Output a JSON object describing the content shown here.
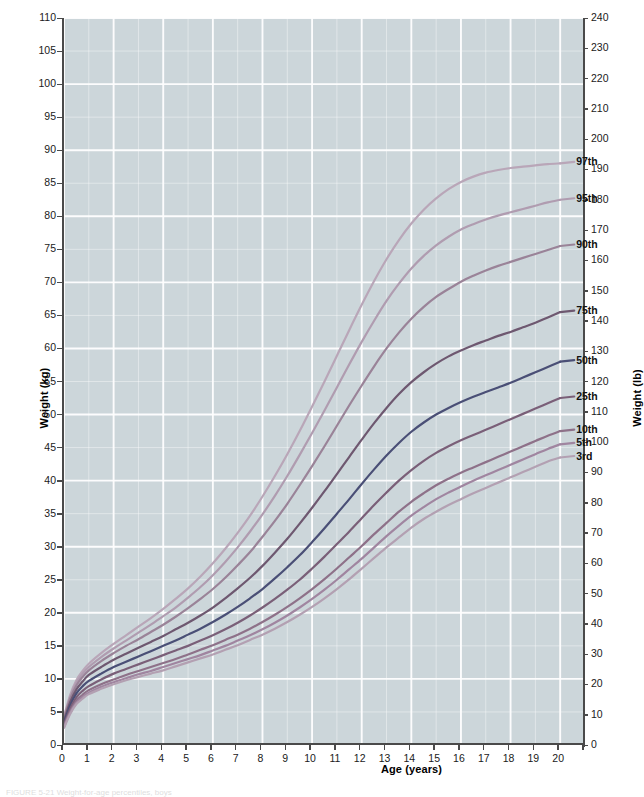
{
  "figure": {
    "caption": "FIGURE 5-21   Weight-for-age percentiles, boys"
  },
  "chart_data": {
    "type": "line",
    "title": "",
    "xlabel": "Age (years)",
    "ylabel": "Weight (kg)",
    "ylabel_secondary": "Weight (lb)",
    "xlim": [
      0,
      21
    ],
    "ylim": [
      0,
      110
    ],
    "ylim_secondary": [
      0,
      240
    ],
    "grid": true,
    "legend_position": "inline-right-end-labels",
    "background_color": "#ccd6da",
    "gridline_color": "#ffffff",
    "axis_color": "#4a4a4a",
    "xticks": [
      0,
      1,
      2,
      3,
      4,
      5,
      6,
      7,
      8,
      9,
      10,
      11,
      12,
      13,
      14,
      15,
      16,
      17,
      18,
      19,
      20
    ],
    "xtick_labels": [
      "0",
      "1",
      "2",
      "3",
      "4",
      "5",
      "6",
      "7",
      "8",
      "9",
      "10",
      "11",
      "12",
      "13",
      "14",
      "15",
      "16",
      "17",
      "18",
      "19",
      "20"
    ],
    "yticks": [
      0,
      5,
      10,
      15,
      20,
      25,
      30,
      35,
      40,
      45,
      50,
      55,
      60,
      65,
      70,
      75,
      80,
      85,
      90,
      95,
      100,
      105,
      110
    ],
    "ytick_labels": [
      "0",
      "5",
      "10",
      "15",
      "20",
      "25",
      "30",
      "35",
      "40",
      "45",
      "50",
      "55",
      "60",
      "65",
      "70",
      "75",
      "80",
      "85",
      "90",
      "95",
      "100",
      "105",
      "110"
    ],
    "yticks_secondary": [
      0,
      10,
      20,
      30,
      40,
      50,
      60,
      70,
      80,
      90,
      100,
      110,
      120,
      130,
      140,
      150,
      160,
      170,
      180,
      190,
      200,
      210,
      220,
      230,
      240
    ],
    "ytick_labels_secondary": [
      "0",
      "10",
      "20",
      "30",
      "40",
      "50",
      "60",
      "70",
      "80",
      "90",
      "100",
      "110",
      "120",
      "130",
      "140",
      "150",
      "160",
      "170",
      "180",
      "190",
      "200",
      "210",
      "220",
      "230",
      "240"
    ],
    "x": [
      0,
      0.25,
      0.5,
      0.75,
      1,
      1.5,
      2,
      2.5,
      3,
      3.5,
      4,
      4.5,
      5,
      5.5,
      6,
      6.5,
      7,
      7.5,
      8,
      8.5,
      9,
      9.5,
      10,
      10.5,
      11,
      11.5,
      12,
      12.5,
      13,
      13.5,
      14,
      14.5,
      15,
      15.5,
      16,
      16.5,
      17,
      17.5,
      18,
      18.5,
      19,
      19.5,
      20
    ],
    "series": [
      {
        "name": "97th",
        "label": "97th",
        "color": "#b9a6b8",
        "end_value_kg": 88.0,
        "end_value_lb": 194,
        "values": [
          4.3,
          7.6,
          9.8,
          11.2,
          12.3,
          13.9,
          15.3,
          16.6,
          17.9,
          19.2,
          20.6,
          22.1,
          23.7,
          25.5,
          27.5,
          29.7,
          32.1,
          34.7,
          37.6,
          40.7,
          44.0,
          47.5,
          51.2,
          55.0,
          58.9,
          62.8,
          66.6,
          70.2,
          73.5,
          76.4,
          78.9,
          81.0,
          82.7,
          84.1,
          85.2,
          86.0,
          86.6,
          87.0,
          87.3,
          87.5,
          87.7,
          87.9,
          88.0
        ]
      },
      {
        "name": "95th",
        "label": "95th",
        "color": "#b09cb0",
        "end_value_kg": 82.5,
        "end_value_lb": 182,
        "values": [
          4.2,
          7.3,
          9.4,
          10.8,
          11.8,
          13.3,
          14.6,
          15.8,
          17.0,
          18.2,
          19.5,
          20.8,
          22.3,
          23.9,
          25.7,
          27.7,
          29.9,
          32.3,
          34.9,
          37.7,
          40.7,
          43.9,
          47.2,
          50.6,
          54.1,
          57.6,
          61.0,
          64.2,
          67.2,
          69.8,
          72.1,
          74.0,
          75.6,
          76.9,
          78.0,
          78.8,
          79.5,
          80.1,
          80.6,
          81.1,
          81.6,
          82.1,
          82.5
        ]
      },
      {
        "name": "90th",
        "label": "90th",
        "color": "#9a8398",
        "end_value_kg": 75.5,
        "end_value_lb": 166,
        "values": [
          4.0,
          7.0,
          9.0,
          10.3,
          11.3,
          12.7,
          13.9,
          15.0,
          16.0,
          17.1,
          18.2,
          19.4,
          20.7,
          22.1,
          23.6,
          25.3,
          27.2,
          29.2,
          31.5,
          33.9,
          36.5,
          39.3,
          42.2,
          45.2,
          48.3,
          51.4,
          54.4,
          57.3,
          60.0,
          62.4,
          64.5,
          66.3,
          67.8,
          69.0,
          70.1,
          71.0,
          71.8,
          72.5,
          73.1,
          73.7,
          74.3,
          74.9,
          75.5
        ]
      },
      {
        "name": "75th",
        "label": "75th",
        "color": "#6e5870",
        "end_value_kg": 65.5,
        "end_value_lb": 144,
        "values": [
          3.7,
          6.5,
          8.4,
          9.6,
          10.6,
          11.8,
          12.9,
          13.8,
          14.7,
          15.6,
          16.5,
          17.5,
          18.5,
          19.6,
          20.8,
          22.2,
          23.7,
          25.3,
          27.1,
          29.1,
          31.2,
          33.5,
          35.9,
          38.4,
          41.0,
          43.6,
          46.2,
          48.7,
          51.0,
          53.1,
          54.9,
          56.4,
          57.7,
          58.8,
          59.7,
          60.5,
          61.2,
          61.9,
          62.5,
          63.2,
          63.9,
          64.7,
          65.5
        ]
      },
      {
        "name": "50th",
        "label": "50th",
        "color": "#4a4f76",
        "end_value_kg": 58.0,
        "end_value_lb": 128,
        "values": [
          3.4,
          6.0,
          7.8,
          8.9,
          9.7,
          10.8,
          11.8,
          12.6,
          13.4,
          14.2,
          15.0,
          15.8,
          16.7,
          17.6,
          18.6,
          19.7,
          20.9,
          22.2,
          23.6,
          25.2,
          26.9,
          28.7,
          30.7,
          32.8,
          35.0,
          37.2,
          39.5,
          41.7,
          43.8,
          45.7,
          47.4,
          48.8,
          50.0,
          51.0,
          51.9,
          52.7,
          53.4,
          54.1,
          54.8,
          55.6,
          56.4,
          57.2,
          58.0
        ]
      },
      {
        "name": "25th",
        "label": "25th",
        "color": "#7a5f78",
        "end_value_kg": 52.5,
        "end_value_lb": 116,
        "values": [
          3.1,
          5.5,
          7.2,
          8.2,
          8.9,
          9.9,
          10.8,
          11.5,
          12.2,
          12.9,
          13.6,
          14.3,
          15.0,
          15.8,
          16.6,
          17.5,
          18.5,
          19.6,
          20.8,
          22.1,
          23.5,
          25.0,
          26.7,
          28.5,
          30.4,
          32.3,
          34.3,
          36.3,
          38.2,
          40.0,
          41.6,
          43.0,
          44.2,
          45.2,
          46.1,
          46.9,
          47.7,
          48.5,
          49.3,
          50.1,
          50.9,
          51.7,
          52.5
        ]
      },
      {
        "name": "10th",
        "label": "10th",
        "color": "#8e7189",
        "end_value_kg": 47.5,
        "end_value_lb": 105,
        "values": [
          2.9,
          5.1,
          6.7,
          7.6,
          8.3,
          9.2,
          9.9,
          10.6,
          11.2,
          11.8,
          12.4,
          13.0,
          13.7,
          14.4,
          15.1,
          15.9,
          16.7,
          17.6,
          18.6,
          19.7,
          20.9,
          22.2,
          23.6,
          25.1,
          26.7,
          28.4,
          30.1,
          31.9,
          33.6,
          35.3,
          36.8,
          38.1,
          39.3,
          40.3,
          41.2,
          42.0,
          42.8,
          43.6,
          44.4,
          45.2,
          46.0,
          46.8,
          47.5
        ]
      },
      {
        "name": "5th",
        "label": "5th",
        "color": "#a085a0",
        "end_value_kg": 45.5,
        "end_value_lb": 100,
        "values": [
          2.7,
          4.9,
          6.4,
          7.3,
          7.9,
          8.8,
          9.5,
          10.1,
          10.7,
          11.2,
          11.8,
          12.4,
          13.0,
          13.6,
          14.3,
          15.0,
          15.8,
          16.6,
          17.5,
          18.5,
          19.6,
          20.8,
          22.1,
          23.5,
          25.0,
          26.6,
          28.2,
          29.9,
          31.6,
          33.2,
          34.7,
          36.0,
          37.2,
          38.2,
          39.1,
          40.0,
          40.8,
          41.6,
          42.4,
          43.2,
          44.0,
          44.8,
          45.5
        ]
      },
      {
        "name": "3rd",
        "label": "3rd",
        "color": "#b3a0b2",
        "end_value_kg": 43.5,
        "end_value_lb": 96,
        "values": [
          2.6,
          4.7,
          6.2,
          7.0,
          7.7,
          8.5,
          9.2,
          9.8,
          10.3,
          10.8,
          11.3,
          11.9,
          12.5,
          13.1,
          13.7,
          14.4,
          15.1,
          15.9,
          16.7,
          17.6,
          18.6,
          19.7,
          20.9,
          22.2,
          23.6,
          25.1,
          26.7,
          28.3,
          29.9,
          31.4,
          32.9,
          34.2,
          35.3,
          36.3,
          37.2,
          38.1,
          38.9,
          39.7,
          40.5,
          41.3,
          42.1,
          42.9,
          43.5
        ]
      }
    ]
  }
}
